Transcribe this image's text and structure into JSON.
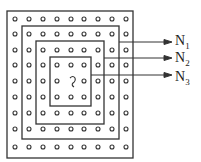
{
  "diagram": {
    "grid": {
      "rows": 9,
      "cols": 9
    },
    "center_symbol": "~",
    "loops": [
      {
        "id": "N1",
        "label_main": "N",
        "label_sub": "1"
      },
      {
        "id": "N2",
        "label_main": "N",
        "label_sub": "2"
      },
      {
        "id": "N3",
        "label_main": "N",
        "label_sub": "3"
      }
    ]
  }
}
